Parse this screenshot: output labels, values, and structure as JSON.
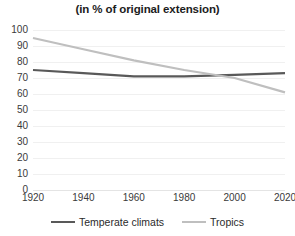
{
  "chart_data": {
    "type": "line",
    "title": "(in % of original extension)",
    "xlabel": "",
    "ylabel": "",
    "x": [
      1920,
      1940,
      1960,
      1980,
      2000,
      2020
    ],
    "xlim": [
      1920,
      2020
    ],
    "ylim": [
      0,
      100
    ],
    "yticks": [
      0,
      10,
      20,
      30,
      40,
      50,
      60,
      70,
      80,
      90,
      100
    ],
    "xticks": [
      1920,
      1940,
      1960,
      1980,
      2000,
      2020
    ],
    "grid": true,
    "legend_position": "bottom",
    "series": [
      {
        "name": "Temperate climats",
        "color": "#595959",
        "values": [
          75,
          73,
          71,
          71,
          72,
          73
        ]
      },
      {
        "name": "Tropics",
        "color": "#bfbfbf",
        "values": [
          95,
          88,
          81,
          75,
          70,
          61
        ]
      }
    ]
  },
  "legend": {
    "items": [
      {
        "label": "Temperate climats",
        "color": "#595959"
      },
      {
        "label": "Tropics",
        "color": "#bfbfbf"
      }
    ]
  },
  "colors": {
    "background": "#ffffff",
    "grid": "#f0f0f0",
    "text": "#2b2b2b",
    "temperate": "#595959",
    "tropics": "#bfbfbf"
  }
}
